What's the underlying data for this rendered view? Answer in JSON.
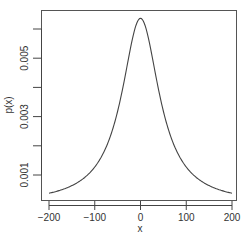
{
  "chart_data": {
    "type": "line",
    "title": "",
    "xlabel": "x",
    "ylabel": "p(x)",
    "xlim": [
      -200,
      200
    ],
    "ylim": [
      0.0003,
      0.0066
    ],
    "x_ticks": [
      -200,
      -100,
      0,
      100,
      200
    ],
    "x_tick_labels": [
      "−200",
      "−100",
      "0",
      "100",
      "200"
    ],
    "y_ticks": [
      0.001,
      0.002,
      0.003,
      0.004,
      0.005,
      0.006
    ],
    "y_tick_labels": [
      "0.001",
      "",
      "0.003",
      "",
      "0.005",
      ""
    ],
    "grid": false,
    "legend": "none",
    "series": [
      {
        "name": "p(x)",
        "description": "Cauchy density, location 0, scale 50",
        "x": [
          -200,
          -175,
          -150,
          -125,
          -100,
          -75,
          -50,
          -40,
          -30,
          -20,
          -10,
          0,
          10,
          20,
          30,
          40,
          50,
          75,
          100,
          125,
          150,
          175,
          200
        ],
        "y": [
          0.000374,
          0.000484,
          0.000637,
          0.000878,
          0.001273,
          0.001959,
          0.003183,
          0.003881,
          0.004681,
          0.005488,
          0.006121,
          0.006366,
          0.006121,
          0.005488,
          0.004681,
          0.003881,
          0.003183,
          0.001959,
          0.001273,
          0.000878,
          0.000637,
          0.000484,
          0.000374
        ]
      }
    ]
  }
}
